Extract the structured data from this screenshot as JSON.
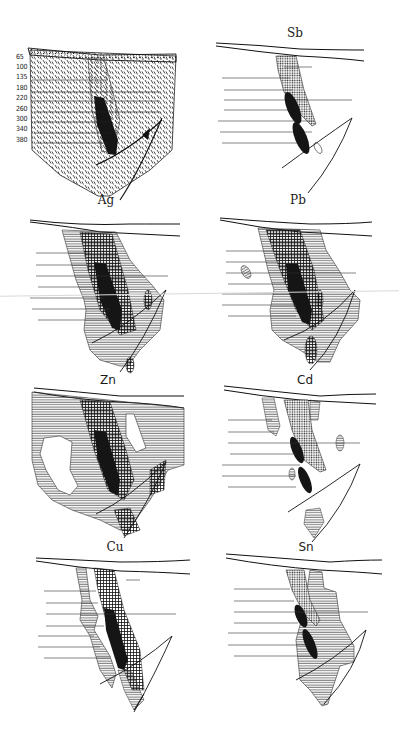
{
  "figure": {
    "background": "#ffffff",
    "ink_color": "#1a1a1a",
    "panels": [
      {
        "id": "geology",
        "label": "",
        "position": "top-left"
      },
      {
        "id": "sb",
        "label": "Sb",
        "position": "top-right"
      },
      {
        "id": "ag",
        "label": "Ag",
        "position": "row2-left"
      },
      {
        "id": "pb",
        "label": "Pb",
        "position": "row2-right"
      },
      {
        "id": "zn",
        "label": "Zn",
        "position": "row3-left"
      },
      {
        "id": "cd",
        "label": "Cd",
        "position": "row3-right"
      },
      {
        "id": "cu",
        "label": "Cu",
        "position": "row4-left"
      },
      {
        "id": "sn",
        "label": "Sn",
        "position": "row4-right"
      }
    ],
    "depth_levels": [
      "65",
      "100",
      "135",
      "180",
      "220",
      "260",
      "300",
      "340",
      "380"
    ],
    "legend_patterns": {
      "ore_body": "solid-black",
      "high_concentration": "cross-hatch",
      "medium_concentration": "dotted-grid",
      "low_concentration": "horizontal-lines",
      "host_rock": "diagonal-dashes",
      "overburden": "dotted-band"
    }
  }
}
